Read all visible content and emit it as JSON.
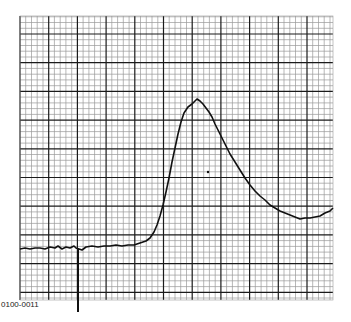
{
  "figure": {
    "label": "0100-0011"
  },
  "grid": {
    "left": 20,
    "top": 16,
    "right": 333,
    "bottom": 300,
    "major_step": 28.7,
    "minor_per_major": 5,
    "major_color": "#1a1a1a",
    "minor_color": "#9a9a9a"
  },
  "colors": {
    "trace": "#111111",
    "background": "#ffffff"
  },
  "chart_data": {
    "type": "line",
    "title": "",
    "xlabel": "",
    "ylabel": "",
    "grid": true,
    "legend": null,
    "annotations": [
      "0100-0011"
    ],
    "marker_spike": {
      "x": 78,
      "y_from": 248,
      "y_to": 312
    },
    "stray_dot": {
      "x": 208,
      "y": 172
    },
    "series": [
      {
        "name": "trace",
        "points_px": [
          [
            20,
            249
          ],
          [
            25,
            248
          ],
          [
            30,
            249
          ],
          [
            35,
            248
          ],
          [
            40,
            248
          ],
          [
            45,
            249
          ],
          [
            50,
            247
          ],
          [
            55,
            248
          ],
          [
            58,
            246
          ],
          [
            62,
            249
          ],
          [
            66,
            247
          ],
          [
            70,
            248
          ],
          [
            74,
            246
          ],
          [
            76,
            248
          ],
          [
            82,
            250
          ],
          [
            86,
            247
          ],
          [
            92,
            246
          ],
          [
            98,
            247
          ],
          [
            104,
            246
          ],
          [
            110,
            246
          ],
          [
            116,
            245
          ],
          [
            122,
            246
          ],
          [
            128,
            245
          ],
          [
            134,
            245
          ],
          [
            140,
            243
          ],
          [
            146,
            241
          ],
          [
            150,
            238
          ],
          [
            154,
            232
          ],
          [
            157,
            225
          ],
          [
            160,
            216
          ],
          [
            163,
            205
          ],
          [
            166,
            192
          ],
          [
            169,
            178
          ],
          [
            172,
            162
          ],
          [
            175,
            148
          ],
          [
            178,
            134
          ],
          [
            181,
            122
          ],
          [
            184,
            113
          ],
          [
            188,
            107
          ],
          [
            192,
            104
          ],
          [
            195,
            101
          ],
          [
            197,
            99
          ],
          [
            200,
            101
          ],
          [
            203,
            104
          ],
          [
            206,
            108
          ],
          [
            209,
            112
          ],
          [
            212,
            117
          ],
          [
            215,
            124
          ],
          [
            218,
            130
          ],
          [
            222,
            138
          ],
          [
            226,
            146
          ],
          [
            230,
            154
          ],
          [
            235,
            162
          ],
          [
            240,
            170
          ],
          [
            245,
            178
          ],
          [
            250,
            185
          ],
          [
            255,
            191
          ],
          [
            260,
            196
          ],
          [
            265,
            200
          ],
          [
            270,
            205
          ],
          [
            275,
            208
          ],
          [
            280,
            211
          ],
          [
            285,
            213
          ],
          [
            290,
            215
          ],
          [
            295,
            217
          ],
          [
            300,
            219
          ],
          [
            305,
            218
          ],
          [
            310,
            218
          ],
          [
            315,
            217
          ],
          [
            320,
            216
          ],
          [
            325,
            213
          ],
          [
            330,
            211
          ],
          [
            333,
            208
          ]
        ]
      }
    ],
    "peak": {
      "x": 197,
      "y": 99
    },
    "baseline_y": 248
  }
}
